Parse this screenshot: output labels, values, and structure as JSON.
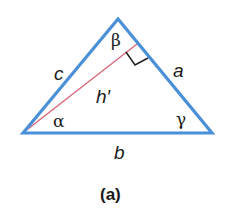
{
  "figure": {
    "caption": "(a)",
    "colors": {
      "triangle_stroke": "#4a90d9",
      "altitude_stroke": "#d9667a",
      "right_angle_stroke": "#222222",
      "text": "#1a1a1a"
    },
    "vertices": {
      "left": {
        "x": 23,
        "y": 133,
        "angle_label": "α"
      },
      "top": {
        "x": 118,
        "y": 19,
        "angle_label": "β"
      },
      "right": {
        "x": 212,
        "y": 133,
        "angle_label": "γ"
      }
    },
    "sides": {
      "c": "c",
      "a": "a",
      "b": "b"
    },
    "altitude": {
      "label": "h′",
      "from": "left",
      "to_side": "a"
    }
  }
}
